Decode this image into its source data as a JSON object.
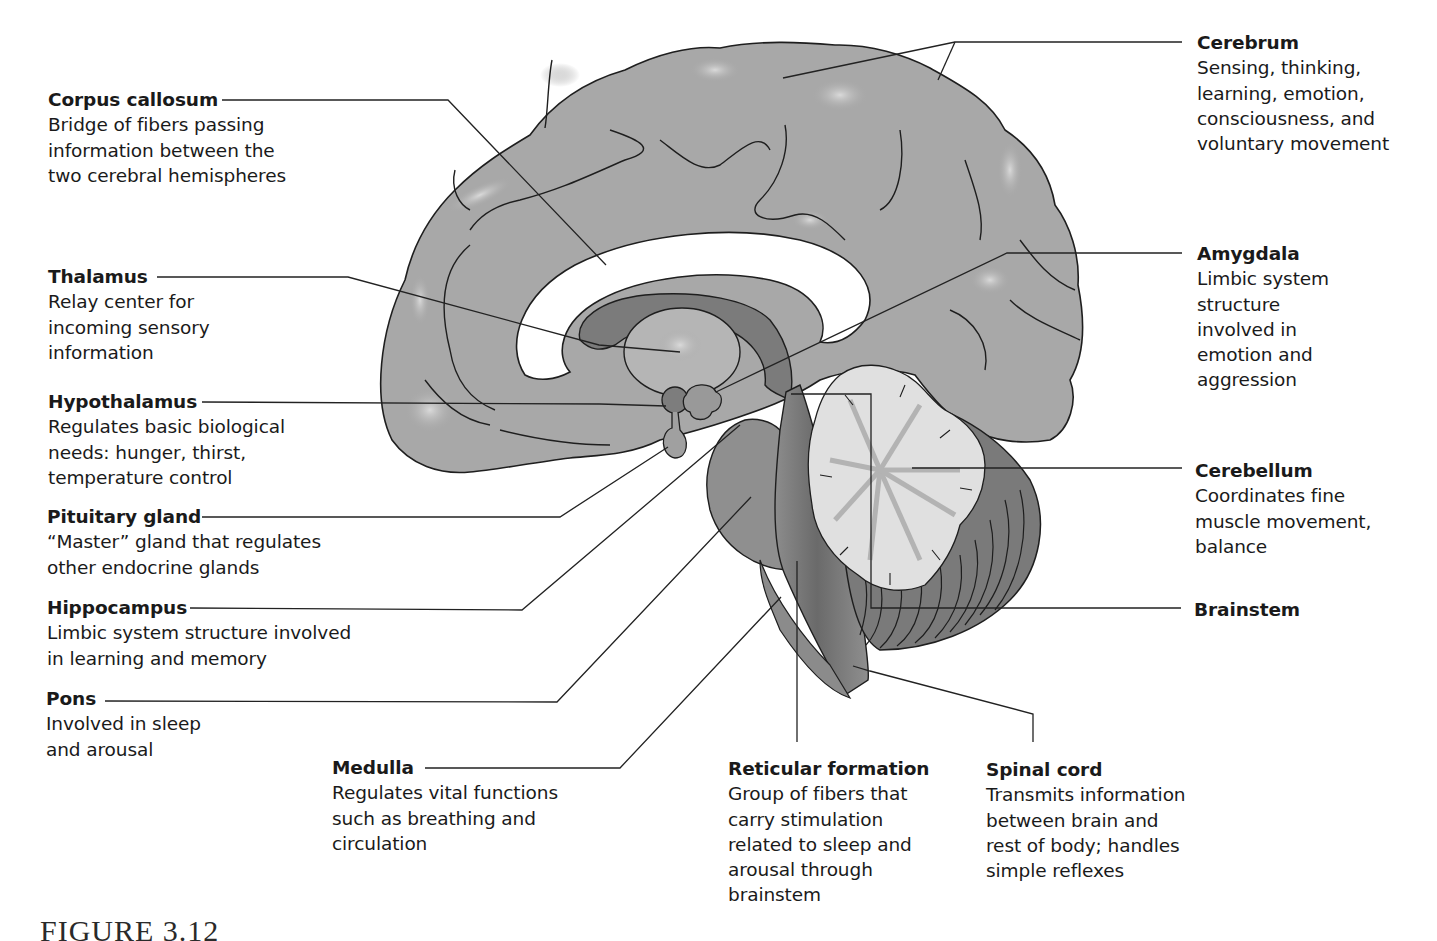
{
  "figure": {
    "caption": "FIGURE 3.12"
  },
  "colors": {
    "background": "#ffffff",
    "cortex": "#a9a9a9",
    "cortex_highlight": "#cfcfcf",
    "corpus_callosum": "#ffffff",
    "limbic_dark": "#7d7d7d",
    "thalamus": "#b8b8b8",
    "brainstem": "#8a8a8a",
    "cerebellum_white": "#e2e2e2",
    "cerebellum_gray": "#777777",
    "line": "#222222"
  },
  "labels": [
    {
      "id": "corpus-callosum",
      "title": "Corpus callosum",
      "desc": "Bridge of fibers passing\ninformation between the\ntwo cerebral hemispheres",
      "x": 48,
      "y": 87
    },
    {
      "id": "thalamus",
      "title": "Thalamus",
      "desc": "Relay center for\nincoming sensory\ninformation",
      "x": 48,
      "y": 264
    },
    {
      "id": "hypothalamus",
      "title": "Hypothalamus",
      "desc": "Regulates basic biological\nneeds: hunger, thirst,\ntemperature control",
      "x": 48,
      "y": 389
    },
    {
      "id": "pituitary-gland",
      "title": "Pituitary gland",
      "desc": "“Master” gland that regulates\nother endocrine glands",
      "x": 47,
      "y": 504
    },
    {
      "id": "hippocampus",
      "title": "Hippocampus",
      "desc": "Limbic system structure involved\nin learning and memory",
      "x": 47,
      "y": 595
    },
    {
      "id": "pons",
      "title": "Pons",
      "desc": "Involved in sleep\nand arousal",
      "x": 46,
      "y": 686
    },
    {
      "id": "medulla",
      "title": "Medulla",
      "desc": "Regulates vital functions\nsuch as breathing and\ncirculation",
      "x": 332,
      "y": 755
    },
    {
      "id": "reticular-formation",
      "title": "Reticular formation",
      "desc": "Group of fibers that\ncarry stimulation\nrelated to sleep and\narousal through\nbrainstem",
      "x": 728,
      "y": 756
    },
    {
      "id": "spinal-cord",
      "title": "Spinal cord",
      "desc": "Transmits information\nbetween brain and\nrest of body; handles\nsimple reflexes",
      "x": 986,
      "y": 757
    },
    {
      "id": "cerebrum",
      "title": "Cerebrum",
      "desc": "Sensing, thinking,\nlearning, emotion,\nconsciousness, and\nvoluntary movement",
      "x": 1197,
      "y": 30
    },
    {
      "id": "amygdala",
      "title": "Amygdala",
      "desc": "Limbic system\nstructure\ninvolved in\nemotion and\naggression",
      "x": 1197,
      "y": 241
    },
    {
      "id": "cerebellum",
      "title": "Cerebellum",
      "desc": "Coordinates fine\nmuscle movement,\nbalance",
      "x": 1195,
      "y": 458
    },
    {
      "id": "brainstem",
      "title": "Brainstem",
      "desc": "",
      "x": 1194,
      "y": 597
    }
  ],
  "leader_lines": [
    {
      "id": "corpus-callosum",
      "points": "222,100 448,100 606,265"
    },
    {
      "id": "cerebrum-a",
      "points": "1182,42 955,42 783,78"
    },
    {
      "id": "cerebrum-b",
      "points": "955,42 938,80"
    },
    {
      "id": "thalamus",
      "points": "157,277 348,277 599,345 680,352"
    },
    {
      "id": "amygdala",
      "points": "1182,253 1007,253 716,392"
    },
    {
      "id": "hypothalamus",
      "points": "202,402 600,404 666,406"
    },
    {
      "id": "pituitary-gland",
      "points": "202,517 560,517 668,447"
    },
    {
      "id": "hippocampus",
      "points": "190,608 522,610 740,425"
    },
    {
      "id": "pons",
      "points": "105,701 557,702 751,497"
    },
    {
      "id": "medulla",
      "points": "425,768 620,768 781,597"
    },
    {
      "id": "reticular-formation",
      "points": "797,742 797,561"
    },
    {
      "id": "spinal-cord",
      "points": "1033,742 1033,714 870,671 853,666"
    },
    {
      "id": "cerebellum",
      "points": "1182,468 912,468"
    },
    {
      "id": "brainstem",
      "points": "1181,608 871,608 871,394 791,394"
    }
  ]
}
